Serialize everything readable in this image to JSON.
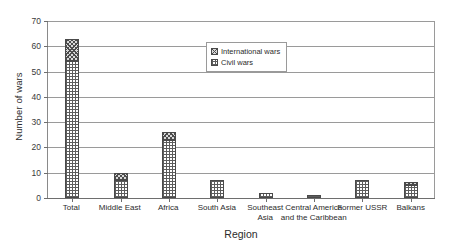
{
  "chart_data": {
    "type": "bar",
    "stacked": true,
    "title": "",
    "xlabel": "Region",
    "ylabel": "Number of wars",
    "ylim": [
      0,
      70
    ],
    "yticks": [
      0,
      10,
      20,
      30,
      40,
      50,
      60,
      70
    ],
    "grid": true,
    "legend_position": "upper-center-right",
    "categories": [
      "Total",
      "Middle East",
      "Africa",
      "South Asia",
      "Southeast Asia",
      "Central America and the Caribbean",
      "Former USSR",
      "Balkans"
    ],
    "category_lines": [
      [
        "Total"
      ],
      [
        "Middle East"
      ],
      [
        "Africa"
      ],
      [
        "South Asia"
      ],
      [
        "Southeast",
        "Asia"
      ],
      [
        "Central America",
        "and the Caribbean"
      ],
      [
        "Former USSR"
      ],
      [
        "Balkans"
      ]
    ],
    "series": [
      {
        "name": "Civil wars",
        "values": [
          54,
          7,
          23,
          7,
          2,
          1,
          7,
          5
        ]
      },
      {
        "name": "International wars",
        "values": [
          9,
          3,
          3,
          0,
          0,
          0,
          0,
          1.5
        ]
      }
    ],
    "totals": [
      63,
      10,
      26,
      7,
      2,
      1,
      7,
      6.5
    ]
  },
  "legend": {
    "entries": [
      {
        "label": "International wars",
        "pattern": "diagonal-crosshatch"
      },
      {
        "label": "Civil wars",
        "pattern": "grid-crosshatch"
      }
    ]
  },
  "colors": {
    "axis": "#6e6e6e",
    "grid": "#9a9a9a",
    "bar_outline": "#4a4a4a",
    "text": "#2b2b2b",
    "background": "#ffffff"
  }
}
